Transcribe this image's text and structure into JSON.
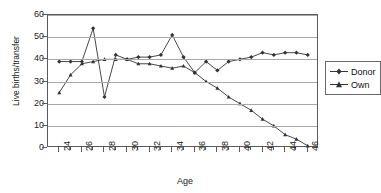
{
  "chart_data": {
    "type": "line",
    "title": "",
    "xlabel": "Age",
    "ylabel": "Live births/transfer",
    "xlim": [
      23,
      47
    ],
    "ylim": [
      0,
      60
    ],
    "yticks": [
      0,
      10,
      20,
      30,
      40,
      50,
      60
    ],
    "xticks": [
      24,
      26,
      28,
      30,
      32,
      34,
      36,
      38,
      40,
      42,
      44,
      46
    ],
    "x_minor_step": 1,
    "grid": "horizontal",
    "legend_position": "right",
    "x": [
      24,
      25,
      26,
      27,
      28,
      29,
      30,
      31,
      32,
      33,
      34,
      35,
      36,
      37,
      38,
      39,
      40,
      41,
      42,
      43,
      44,
      45,
      46
    ],
    "series": [
      {
        "name": "Donor",
        "marker": "diamond",
        "color": "#333333",
        "values": [
          39,
          39,
          39,
          54,
          23,
          42,
          40,
          41,
          41,
          42,
          51,
          41,
          34,
          39,
          35,
          39,
          40,
          41,
          43,
          42,
          43,
          43,
          42
        ]
      },
      {
        "name": "Own",
        "marker": "triangle",
        "color": "#333333",
        "values": [
          25,
          33,
          38,
          39,
          40,
          40,
          40,
          38,
          38,
          37,
          36,
          37,
          34,
          30,
          27,
          23,
          20,
          17,
          13,
          10,
          6,
          4,
          1
        ]
      }
    ]
  },
  "legend": {
    "items": [
      {
        "label": "Donor"
      },
      {
        "label": "Own"
      }
    ]
  }
}
